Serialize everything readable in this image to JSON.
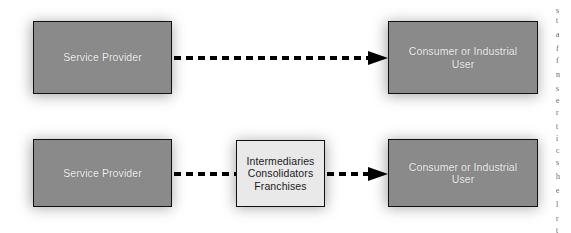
{
  "figure": {
    "background_color": "#ffffff"
  },
  "colors": {
    "actor_fill": "#8a8a8a",
    "actor_text": "#f2f2f2",
    "intermediary_fill": "#e9e9e9",
    "intermediary_text": "#1b1b1b",
    "border": "#111111",
    "connector": "#000000",
    "shadow": "#9a9a9a"
  },
  "rows": [
    {
      "name": "direct-channel",
      "nodes": [
        {
          "id": "provider-direct",
          "label": "Service Provider",
          "kind": "actor"
        },
        {
          "id": "consumer-direct",
          "label": "Consumer or Industrial\nUser",
          "kind": "actor"
        }
      ],
      "connectors": [
        {
          "id": "provider-to-consumer-direct",
          "style": "dashed",
          "arrow": "right"
        }
      ]
    },
    {
      "name": "indirect-channel",
      "nodes": [
        {
          "id": "provider-indirect",
          "label": "Service Provider",
          "kind": "actor"
        },
        {
          "id": "intermediaries",
          "label": "Intermediaries\nConsolidators\nFranchises",
          "kind": "intermediary"
        },
        {
          "id": "consumer-indirect",
          "label": "Consumer or Industrial\nUser",
          "kind": "actor"
        }
      ],
      "connectors": [
        {
          "id": "provider-to-intermediaries",
          "style": "dashed",
          "arrow": "none"
        },
        {
          "id": "intermediaries-to-consumer",
          "style": "dashed",
          "arrow": "right"
        }
      ]
    }
  ],
  "edge_text_fragments": [
    {
      "text": "s",
      "top": 6
    },
    {
      "text": "t",
      "top": 16
    },
    {
      "text": "a",
      "top": 30
    },
    {
      "text": "f",
      "top": 44
    },
    {
      "text": "f",
      "top": 56
    },
    {
      "text": "n",
      "top": 70
    },
    {
      "text": "s",
      "top": 84
    },
    {
      "text": "e",
      "top": 96
    },
    {
      "text": "r",
      "top": 108
    },
    {
      "text": "t",
      "top": 122
    },
    {
      "text": "i",
      "top": 134
    },
    {
      "text": "c",
      "top": 146
    },
    {
      "text": "s",
      "top": 158
    },
    {
      "text": "h",
      "top": 172
    },
    {
      "text": "e",
      "top": 186
    },
    {
      "text": "l",
      "top": 200
    },
    {
      "text": "r",
      "top": 214
    },
    {
      "text": "t",
      "top": 226
    }
  ]
}
